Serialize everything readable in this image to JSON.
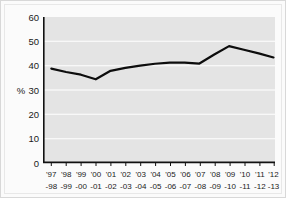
{
  "chart_data": {
    "type": "line",
    "title": "",
    "xlabel": "",
    "ylabel": "%",
    "ylim": [
      0,
      60
    ],
    "yticks": [
      0,
      10,
      20,
      30,
      40,
      50,
      60
    ],
    "grid": true,
    "legend": false,
    "categories": [
      "'97-98",
      "'98-99",
      "'99-00",
      "'00-01",
      "'01-02",
      "'02-03",
      "'03-04",
      "'04-05",
      "'05-06",
      "'06-07",
      "'07-08",
      "'08-09",
      "'09-10",
      "'10-11",
      "'11-12",
      "'12-13"
    ],
    "category_top": [
      "'97",
      "'98",
      "'99",
      "'00",
      "'01",
      "'02",
      "'03",
      "'04",
      "'05",
      "'06",
      "'07",
      "'08",
      "'09",
      "'10",
      "'11",
      "'12"
    ],
    "category_bottom": [
      "-98",
      "-99",
      "-00",
      "-01",
      "-02",
      "-03",
      "-04",
      "-05",
      "-06",
      "-07",
      "-08",
      "-09",
      "-10",
      "-11",
      "-12",
      "-13"
    ],
    "values": [
      38.7,
      37.3,
      36.2,
      34.3,
      37.8,
      39.0,
      39.9,
      40.7,
      41.2,
      41.2,
      40.8,
      44.5,
      48.0,
      46.5,
      45.0,
      43.3
    ],
    "line_color": "#0d0d0d",
    "plot_background": "#e4e4e4",
    "gridline_color": "#ffffff",
    "axis_color": "#111111"
  },
  "axis": {
    "y_label": "%",
    "y_tick_labels": [
      "60",
      "50",
      "40",
      "30",
      "20",
      "10",
      "0"
    ]
  }
}
